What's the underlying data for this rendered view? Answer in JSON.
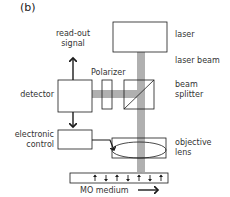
{
  "figure": {
    "panel_label": "(b)",
    "components": {
      "laser": "laser",
      "laser_beam": "laser beam",
      "beam_splitter": [
        "beam",
        "splitter"
      ],
      "objective_lens": [
        "objective",
        "lens"
      ],
      "polarizer": "Polarizer",
      "detector": "detector",
      "electronic_control": [
        "electronic",
        "control"
      ],
      "readout_signal": [
        "read-out",
        "signal"
      ],
      "medium": "MO medium"
    },
    "colors": {
      "beam": "#b0b0b0",
      "line": "#1a1a1a"
    },
    "medium_arrows": [
      "up",
      "down",
      "up",
      "down",
      "up",
      "down",
      "up"
    ]
  }
}
